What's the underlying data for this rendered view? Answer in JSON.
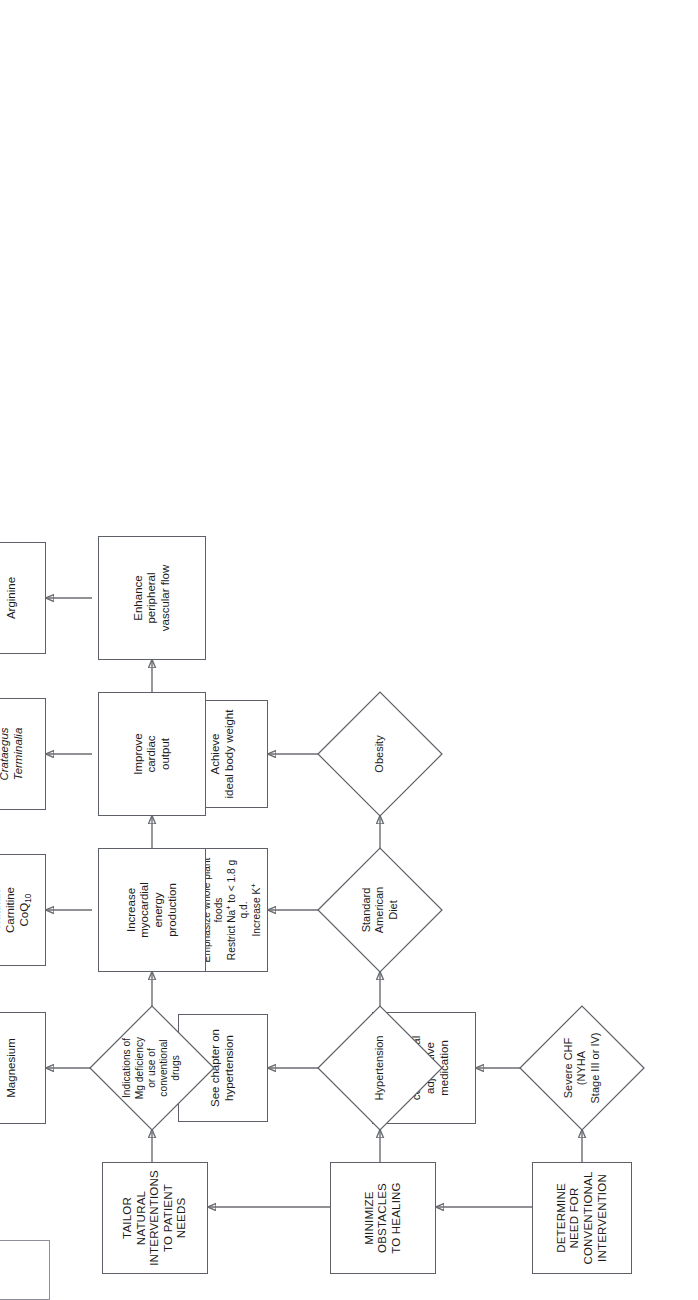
{
  "diagram": {
    "orientation": "rotated-90-ccw",
    "nodes": {
      "determine_need": "DETERMINE\nNEED FOR\nCONVENTIONAL\nINTERVENTION",
      "severe_chf": "Severe CHF\n(NYHA\nStage III or IV)",
      "refer_conventional": "Refer for\nconventional\nadjunctive\nmedication",
      "minimize_obstacles": "MINIMIZE\nOBSTACLES\nTO HEALING",
      "hypertension": "Hypertension",
      "see_chapter": "See chapter on\nhypertension",
      "standard_american_diet": "Standard\nAmerican\nDiet",
      "diet_lines": [
        "Eliminate refined, processed",
        "foods",
        "Reduce saturated animal fats",
        "Emphasize whole plant foods",
        "Restrict Na+ to < 1.8 g q.d.",
        "Increase K+"
      ],
      "obesity": "Obesity",
      "ideal_body_weight": "Achieve\nideal body weight",
      "tailor_natural": "TAILOR\nNATURAL\nINTERVENTIONS\nTO PATIENT\nNEEDS",
      "mg_indications": "Indications of\nMg deficiency\nor use of\nconventional\ndrugs",
      "magnesium": "Magnesium",
      "increase_myocardial": "Increase\nmyocardial\nenergy\nproduction",
      "thiamin_carnitine_coq10": "Thiamin\nCarnitine\nCoQ10",
      "improve_cardiac_output": "Improve\ncardiac\noutput",
      "crataegus_terminalia": "Crataegus\nTerminalia",
      "enhance_peripheral": "Enhance\nperipheral\nvascular flow",
      "arginine": "Arginine"
    },
    "colors": {
      "stroke": "#5d6066",
      "edge": "#6a6d72",
      "text": "#1b1b1b",
      "background": "#ffffff"
    }
  }
}
